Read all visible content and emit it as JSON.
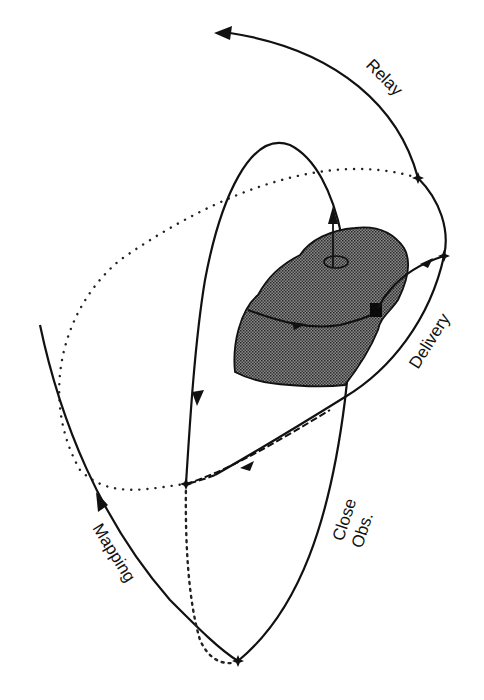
{
  "diagram": {
    "type": "orbital-trajectory",
    "labels": {
      "relay": "Relay",
      "delivery": "Delivery",
      "mapping": "Mapping",
      "close_obs_line1": "Close",
      "close_obs_line2": "Obs."
    },
    "nodes": [
      {
        "id": "relay-departure",
        "x": 418,
        "y": 178
      },
      {
        "id": "delivery-maneuver",
        "x": 444,
        "y": 256
      },
      {
        "id": "mapping-junction",
        "x": 186,
        "y": 484
      },
      {
        "id": "close-obs-periapsis",
        "x": 238,
        "y": 661
      }
    ],
    "body": {
      "name": "asteroid",
      "fill": "#6e6e6e",
      "rotation_axis": true,
      "lander": true
    },
    "colors": {
      "line": "#111111",
      "background": "#ffffff",
      "asteroid": "#6e6e6e"
    }
  }
}
